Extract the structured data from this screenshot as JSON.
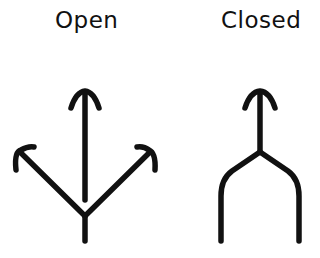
{
  "diagrams": [
    {
      "label": "Open",
      "description": "Three arrows diverging from a single stem: one straight up, one up-left, one up-right"
    },
    {
      "label": "Closed",
      "description": "Single up arrow whose stem splits into two parallel downward legs"
    }
  ],
  "colors": {
    "stroke": "#111111",
    "background": "#ffffff"
  }
}
